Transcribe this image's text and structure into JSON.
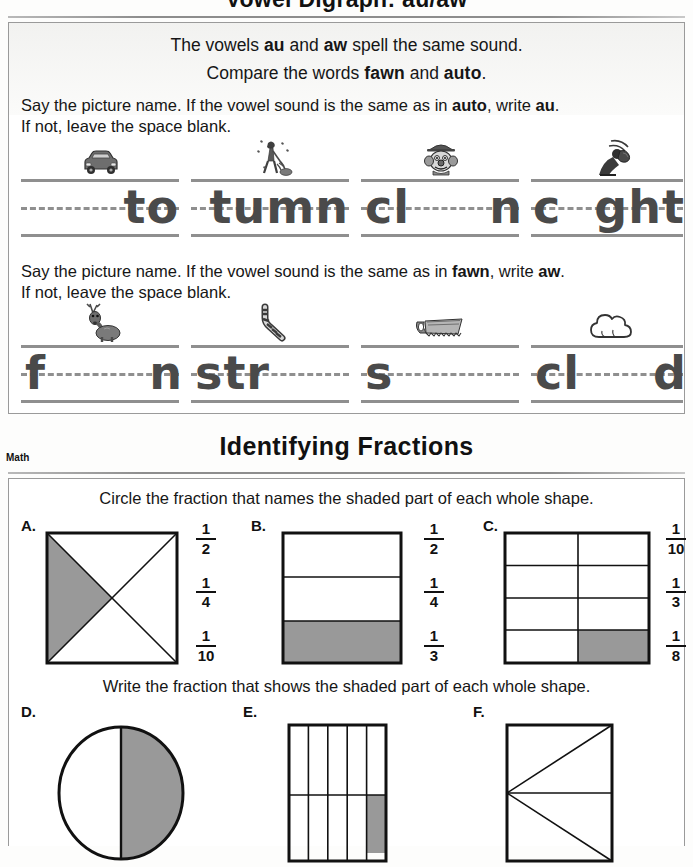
{
  "top_title": "Vowel Digraph: au/aw",
  "reading": {
    "lead_line1": {
      "pre": "The vowels ",
      "b1": "au",
      "mid": " and ",
      "b2": "aw",
      "post": " spell the same sound."
    },
    "lead_line2": {
      "pre": "Compare the words ",
      "b1": "fawn",
      "mid": " and ",
      "b2": "auto",
      "post": "."
    },
    "exercise1": {
      "direction_pre": "Say the picture name. If the vowel sound is the same as in ",
      "direction_bold1": "auto",
      "direction_mid": ", write ",
      "direction_bold2": "au",
      "direction_post": ".",
      "direction_line2": "If not, leave the space blank.",
      "items": [
        {
          "icon": "car-icon",
          "answer_word": "auto",
          "prefix": "",
          "blank": "____",
          "suffix": "to"
        },
        {
          "icon": "raking-leaves-icon",
          "answer_word": "autumn",
          "prefix": "",
          "blank": "___",
          "suffix": "tumn"
        },
        {
          "icon": "clown-icon",
          "answer_word": "clown",
          "prefix": "cl",
          "blank": "___",
          "suffix": "n"
        },
        {
          "icon": "baseball-catcher-icon",
          "answer_word": "caught",
          "prefix": "c",
          "blank": "__",
          "suffix": "ght"
        }
      ]
    },
    "exercise2": {
      "direction_pre": "Say the picture name. If the vowel sound is the same as in ",
      "direction_bold1": "fawn",
      "direction_mid": ", write ",
      "direction_bold2": "aw",
      "direction_post": ".",
      "direction_line2": "If not, leave the space blank.",
      "items": [
        {
          "icon": "fawn-deer-icon",
          "answer_word": "fawn",
          "prefix": "f",
          "blank": "___",
          "suffix": "n"
        },
        {
          "icon": "drinking-straw-icon",
          "answer_word": "straw",
          "prefix": "str",
          "blank": "___",
          "suffix": ""
        },
        {
          "icon": "handsaw-icon",
          "answer_word": "saw",
          "prefix": "s",
          "blank": "___",
          "suffix": ""
        },
        {
          "icon": "cloud-icon",
          "answer_word": "cloud",
          "prefix": "cl",
          "blank": "__",
          "suffix": "d"
        }
      ]
    }
  },
  "math": {
    "subject_tag": "Math",
    "title": "Identifying Fractions",
    "direction_top": "Circle the fraction that names the shaded part of each whole shape.",
    "direction_bottom": "Write the fraction that shows the shaded part of each whole shape.",
    "shade_color": "#999999",
    "line_color": "#111111",
    "multiple_choice": [
      {
        "label": "A.",
        "shape": "square-with-both-diagonals",
        "parts_total": 4,
        "parts_shaded": 1,
        "shaded_description": "left triangle shaded",
        "options": [
          {
            "num": "1",
            "den": "2"
          },
          {
            "num": "1",
            "den": "4"
          },
          {
            "num": "1",
            "den": "10"
          }
        ]
      },
      {
        "label": "B.",
        "shape": "rectangle-three-horizontal-bands",
        "parts_total": 3,
        "parts_shaded": 1,
        "shaded_description": "bottom band shaded",
        "options": [
          {
            "num": "1",
            "den": "2"
          },
          {
            "num": "1",
            "den": "4"
          },
          {
            "num": "1",
            "den": "3"
          }
        ]
      },
      {
        "label": "C.",
        "shape": "grid-2-columns-4-rows",
        "parts_total": 8,
        "parts_shaded": 1,
        "shaded_description": "bottom-right cell shaded",
        "options": [
          {
            "num": "1",
            "den": "10"
          },
          {
            "num": "1",
            "den": "3"
          },
          {
            "num": "1",
            "den": "8"
          }
        ]
      }
    ],
    "write_in": [
      {
        "label": "D.",
        "shape": "circle-split-vertically",
        "parts_total": 2,
        "parts_shaded": 1,
        "shaded_description": "right half shaded"
      },
      {
        "label": "E.",
        "shape": "rectangle-five-columns-two-rows",
        "parts_total": 10,
        "parts_shaded": 1,
        "shaded_description": "bottom-right cell shaded"
      },
      {
        "label": "F.",
        "shape": "rectangle-with-midline-and-two-diagonals",
        "parts_total": 4,
        "parts_shaded": 0,
        "shaded_description": "no cells shaded"
      }
    ]
  }
}
